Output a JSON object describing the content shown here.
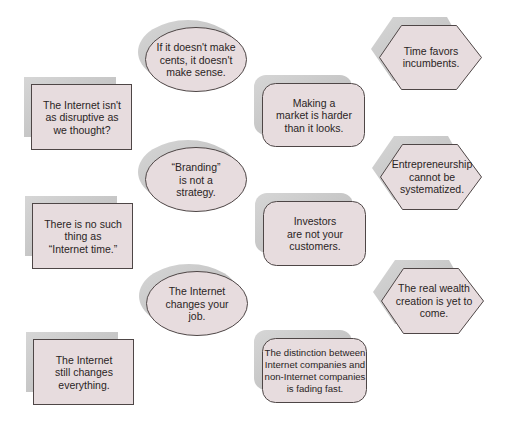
{
  "diagram": {
    "colors": {
      "fill": "#e7dcde",
      "stroke": "#4e4646",
      "shadow": "#c9c9c9",
      "text": "#2a2424"
    },
    "nodes": [
      {
        "id": "n1",
        "shape": "rect",
        "text": "The Internet isn't\nas disruptive as\nwe thought?"
      },
      {
        "id": "n2",
        "shape": "rect",
        "text": "There is no such\nthing as\n“Internet time.”"
      },
      {
        "id": "n3",
        "shape": "rect",
        "text": "The Internet\nstill changes\neverything."
      },
      {
        "id": "n4",
        "shape": "ellipse",
        "text": "If it doesn't make\ncents, it doesn't\nmake sense."
      },
      {
        "id": "n5",
        "shape": "ellipse",
        "text": "“Branding”\nis not a\nstrategy."
      },
      {
        "id": "n6",
        "shape": "ellipse",
        "text": "The Internet\nchanges your\njob."
      },
      {
        "id": "n7",
        "shape": "rounded-rect",
        "text": "Making a\nmarket is harder\nthan it looks."
      },
      {
        "id": "n8",
        "shape": "rounded-rect",
        "text": "Investors\nare not your\ncustomers."
      },
      {
        "id": "n9",
        "shape": "rounded-rect",
        "text": "The distinction between\nInternet companies and\nnon-Internet companies\nis fading fast."
      },
      {
        "id": "n10",
        "shape": "hexagon",
        "text": "Time favors\nincumbents."
      },
      {
        "id": "n11",
        "shape": "hexagon",
        "text": "Entrepreneurship\ncannot be\nsystematized."
      },
      {
        "id": "n12",
        "shape": "hexagon",
        "text": "The real wealth\ncreation is yet to\ncome."
      }
    ]
  }
}
